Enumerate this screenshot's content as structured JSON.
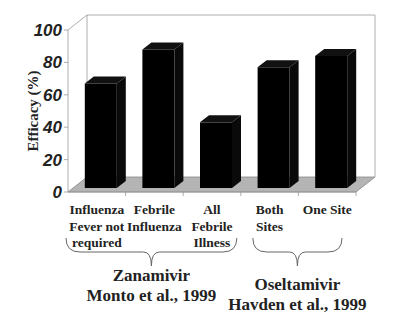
{
  "chart_data": {
    "type": "bar",
    "style": "3d",
    "title": "",
    "xlabel": "",
    "ylabel": "Efficacy (%)",
    "ylim": [
      0,
      100
    ],
    "yticks": [
      "0",
      "20",
      "40",
      "60",
      "80",
      "100"
    ],
    "grid": false,
    "categories": [
      [
        "Influenza",
        "Fever not",
        "required"
      ],
      [
        "Febrile",
        "Influenza"
      ],
      [
        "All",
        "Febrile",
        "Illness"
      ],
      [
        "Both",
        "Sites"
      ],
      [
        "One Site"
      ]
    ],
    "values": [
      67,
      88,
      43,
      77,
      84
    ],
    "bar_color": "#000000",
    "floor_color": "#b4b4b4",
    "groups": [
      {
        "lines": [
          "Zanamivir",
          "Monto et al., 1999"
        ],
        "categories": [
          0,
          1,
          2
        ]
      },
      {
        "lines": [
          "Oseltamivir",
          "Havden et al., 1999"
        ],
        "categories": [
          3,
          4
        ]
      }
    ]
  }
}
